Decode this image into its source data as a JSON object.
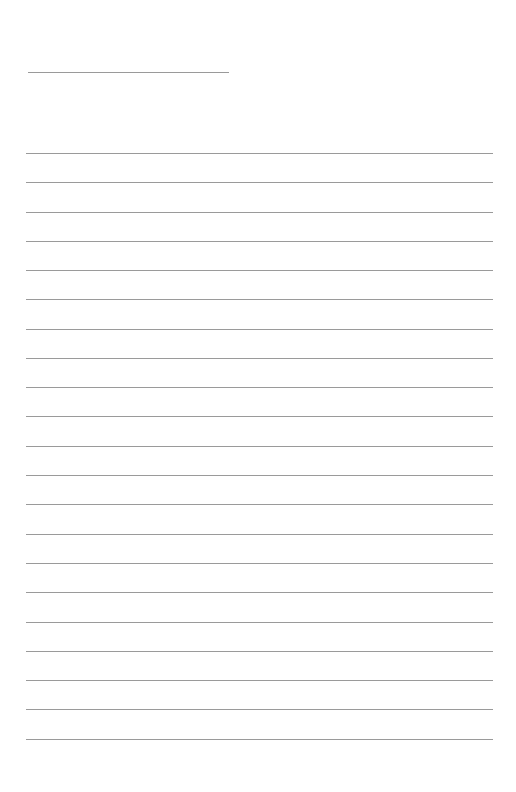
{
  "page": {
    "type": "lined-writing-sheet",
    "background_color": "#ffffff",
    "line_color": "#9a9a9a",
    "header_line": {
      "label": "",
      "y": 72,
      "x_start": 28,
      "x_end": 229
    },
    "writing_lines": {
      "count": 21,
      "x_start": 26,
      "x_end": 493,
      "y_positions": [
        153,
        182,
        212,
        241,
        270,
        299,
        329,
        358,
        387,
        416,
        446,
        475,
        504,
        534,
        563,
        592,
        622,
        651,
        680,
        709,
        739
      ]
    }
  }
}
